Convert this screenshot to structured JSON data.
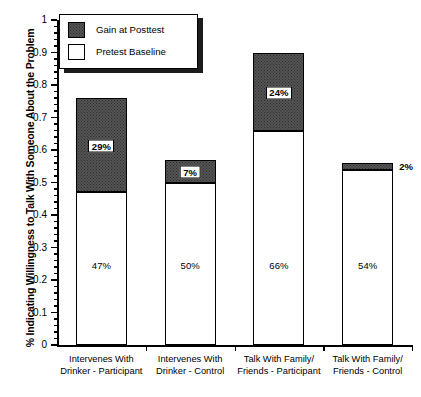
{
  "chart_data": {
    "type": "bar",
    "stacked": true,
    "title": "",
    "xlabel": "",
    "ylabel": "% Indicating Willingness to Talk With Someone About the Problem",
    "ylim": [
      0,
      1
    ],
    "ytick_step": 0.1,
    "grid": false,
    "legend_position": "top-left",
    "categories": [
      "Intervenes With Drinker - Participant",
      "Intervenes With Drinker - Control",
      "Talk With Family/ Friends - Participant",
      "Talk With Family/ Friends - Control"
    ],
    "category_lines": [
      [
        "Intervenes With",
        "Drinker - Participant"
      ],
      [
        "Intervenes With",
        "Drinker - Control"
      ],
      [
        "Talk With Family/",
        "Friends - Participant"
      ],
      [
        "Talk With Family/",
        "Friends - Control"
      ]
    ],
    "series": [
      {
        "name": "Pretest Baseline",
        "values": [
          0.47,
          0.5,
          0.66,
          0.54
        ],
        "labels": [
          "47%",
          "50%",
          "66%",
          "54%"
        ],
        "color": "#ffffff"
      },
      {
        "name": "Gain at Posttest",
        "values": [
          0.29,
          0.07,
          0.24,
          0.02
        ],
        "labels": [
          "29%",
          "7%",
          "24%",
          "2%"
        ],
        "color": "#555555"
      }
    ],
    "totals": [
      0.76,
      0.57,
      0.9,
      0.56
    ],
    "ytick_labels": [
      "1",
      "0.9",
      "0.8",
      "0.7",
      "0.6",
      "0.5",
      "0.4",
      "0.3",
      "0.2",
      "0.1",
      "0"
    ]
  },
  "legend": {
    "items": [
      {
        "label": "Gain at Posttest",
        "swatch": "gain"
      },
      {
        "label": "Pretest Baseline",
        "swatch": "base"
      }
    ]
  },
  "axis": {
    "y_title": "% Indicating Willingness to Talk With Someone About the Problem"
  }
}
